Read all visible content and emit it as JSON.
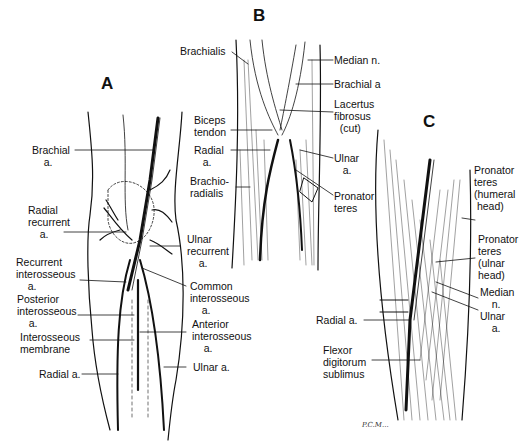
{
  "figure": {
    "panels": [
      {
        "id": "A",
        "letter": "A",
        "labels": [
          {
            "key": "brachial",
            "text": "Brachial\n    a."
          },
          {
            "key": "radial_recurrent",
            "text": "Radial\nrecurrent\n    a."
          },
          {
            "key": "recurrent_interosseous",
            "text": "Recurrent\ninterosseous\n    a."
          },
          {
            "key": "posterior_interosseous",
            "text": "Posterior\ninterosseous\n    a."
          },
          {
            "key": "interosseous_membrane",
            "text": "Interosseous\nmembrane"
          },
          {
            "key": "radial",
            "text": "Radial a."
          },
          {
            "key": "ulnar_recurrent",
            "text": "Ulnar\nrecurrent\n    a."
          },
          {
            "key": "common_interosseous",
            "text": "Common\ninterosseous\n    a."
          },
          {
            "key": "anterior_interosseous",
            "text": "Anterior\ninterosseous\n    a."
          },
          {
            "key": "ulnar",
            "text": "Ulnar a."
          }
        ]
      },
      {
        "id": "B",
        "letter": "B",
        "labels": [
          {
            "key": "brachialis",
            "text": "Brachialis"
          },
          {
            "key": "biceps_tendon",
            "text": "Biceps\ntendon"
          },
          {
            "key": "radial",
            "text": "Radial\n   a."
          },
          {
            "key": "brachioradialis",
            "text": "Brachio-\nradialis"
          },
          {
            "key": "median_n",
            "text": "Median n."
          },
          {
            "key": "brachial_a",
            "text": "Brachial a"
          },
          {
            "key": "lacertus",
            "text": "Lacertus\nfibrosus\n  (cut)"
          },
          {
            "key": "ulnar",
            "text": "Ulnar\n   a."
          },
          {
            "key": "pronator_teres",
            "text": "Pronator\nteres"
          }
        ]
      },
      {
        "id": "C",
        "letter": "C",
        "labels": [
          {
            "key": "pt_humeral",
            "text": "Pronator\nteres\n(humeral\n head)"
          },
          {
            "key": "pt_ulnar",
            "text": "Pronator\nteres\n(ulnar\nhead)"
          },
          {
            "key": "median_n",
            "text": "Median\n    n."
          },
          {
            "key": "ulnar_a",
            "text": "Ulnar\n    a."
          },
          {
            "key": "radial_a",
            "text": "Radial a."
          },
          {
            "key": "fds",
            "text": "Flexor\ndigitorum\nsublimus"
          }
        ]
      }
    ],
    "signature": "P.C.M..."
  }
}
